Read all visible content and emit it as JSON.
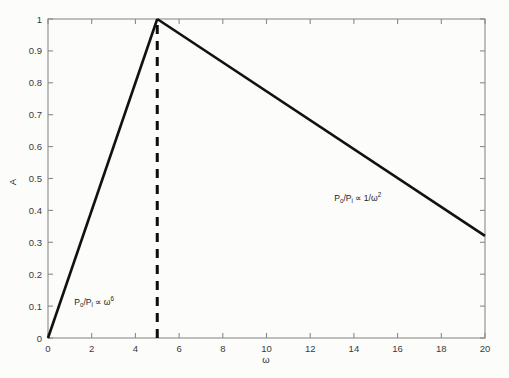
{
  "chart_data": {
    "type": "line",
    "title": "",
    "subtitle": "",
    "xlabel": "ω",
    "ylabel": "A",
    "xlim": [
      0,
      20
    ],
    "ylim": [
      0,
      1
    ],
    "grid": false,
    "legend": "none",
    "xticks": [
      "0",
      "2",
      "4",
      "6",
      "8",
      "10",
      "12",
      "14",
      "16",
      "18",
      "20"
    ],
    "xtick_values": [
      0,
      2,
      4,
      6,
      8,
      10,
      12,
      14,
      16,
      18,
      20
    ],
    "yticks": [
      "0",
      "0.1",
      "0.2",
      "0.3",
      "0.4",
      "0.5",
      "0.6",
      "0.7",
      "0.8",
      "0.9",
      "1"
    ],
    "ytick_values": [
      0,
      0.1,
      0.2,
      0.3,
      0.4,
      0.5,
      0.6,
      0.7,
      0.8,
      0.9,
      1
    ],
    "series": [
      {
        "name": "rising-branch",
        "style": "solid",
        "color": "#111111",
        "x": [
          0,
          5
        ],
        "y": [
          0,
          1
        ]
      },
      {
        "name": "falling-branch",
        "style": "solid",
        "color": "#111111",
        "x": [
          5,
          20
        ],
        "y": [
          1,
          0.32
        ]
      },
      {
        "name": "resonance-marker",
        "style": "dashed",
        "color": "#0d0d0d",
        "x": [
          5,
          5
        ],
        "y": [
          0,
          1
        ]
      }
    ],
    "annotations": [
      {
        "name": "rising-branch-annotation",
        "base": "P",
        "base_sub": "o",
        "divider": "/P",
        "divider_sub": "i",
        "relation": "∝",
        "expr": "ω",
        "expr_sup": "6",
        "x": 1.2,
        "y": 0.105
      },
      {
        "name": "falling-branch-annotation",
        "base": "P",
        "base_sub": "o",
        "divider": "/P",
        "divider_sub": "i",
        "relation": "∝",
        "expr": "1/ω",
        "expr_sup": "2",
        "x": 13.1,
        "y": 0.43
      }
    ]
  },
  "figure": {
    "background_color": "#fcfcfb",
    "axis_color": "#8a8a8a",
    "data_color": "#111111"
  }
}
